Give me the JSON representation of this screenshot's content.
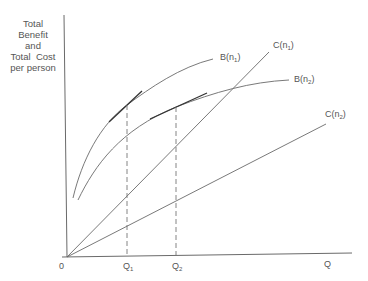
{
  "diagram": {
    "y_axis_label": [
      "Total",
      "Benefit",
      "and",
      "Total  Cost",
      "per person"
    ],
    "x_axis_label": "Q",
    "origin_label": "0",
    "ticks": [
      {
        "main": "Q",
        "sub": "1"
      },
      {
        "main": "Q",
        "sub": "2"
      }
    ],
    "curves": [
      {
        "name": "B",
        "arg": "n",
        "sub": "1",
        "type": "benefit"
      },
      {
        "name": "B",
        "arg": "n",
        "sub": "2",
        "type": "benefit"
      },
      {
        "name": "C",
        "arg": "n",
        "sub": "1",
        "type": "cost"
      },
      {
        "name": "C",
        "arg": "n",
        "sub": "2",
        "type": "cost"
      }
    ],
    "colors": {
      "line": "#6a6a6a",
      "text": "#555555",
      "background": "#ffffff"
    }
  }
}
